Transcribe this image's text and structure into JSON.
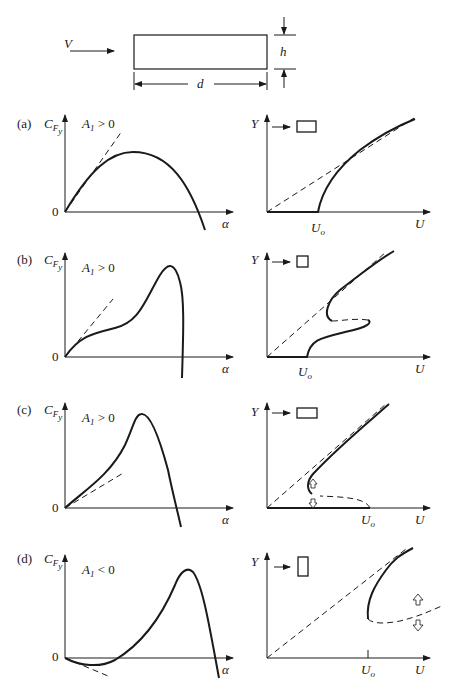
{
  "header": {
    "flow_label": "V",
    "height_label": "h",
    "depth_label": "d"
  },
  "panels": [
    {
      "tag": "(a)",
      "cf_label": "C",
      "cf_sub": "F",
      "cf_subsub": "y",
      "cond": "A",
      "cond_sub": "1",
      "cond_rel": " > 0",
      "zero": "0",
      "alpha": "α",
      "y_label": "Y",
      "u_label": "U",
      "u0_label": "U",
      "u0_sub": "o"
    },
    {
      "tag": "(b)",
      "cf_label": "C",
      "cf_sub": "F",
      "cf_subsub": "y",
      "cond": "A",
      "cond_sub": "1",
      "cond_rel": " > 0",
      "zero": "0",
      "alpha": "α",
      "y_label": "Y",
      "u_label": "U",
      "u0_label": "U",
      "u0_sub": "o"
    },
    {
      "tag": "(c)",
      "cf_label": "C",
      "cf_sub": "F",
      "cf_subsub": "y",
      "cond": "A",
      "cond_sub": "1",
      "cond_rel": " > 0",
      "zero": "0",
      "alpha": "α",
      "y_label": "Y",
      "u_label": "U",
      "u0_label": "U",
      "u0_sub": "o"
    },
    {
      "tag": "(d)",
      "cf_label": "C",
      "cf_sub": "F",
      "cf_subsub": "y",
      "cond": "A",
      "cond_sub": "1",
      "cond_rel": " < 0",
      "zero": "0",
      "alpha": "α",
      "y_label": "Y",
      "u_label": "U",
      "u0_label": "U",
      "u0_sub": "o"
    }
  ],
  "colors": {
    "ink": "#1a1a1a",
    "background": "#ffffff"
  }
}
